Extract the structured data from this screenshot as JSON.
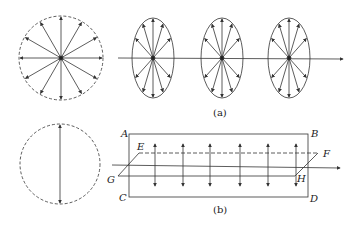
{
  "figure": {
    "part_a": {
      "caption": "(a)",
      "description": "Unpolarized light: radial vectors in all directions, propagating along axis"
    },
    "part_b": {
      "caption": "(b)",
      "description": "Linearly polarized light: vertical vectors in plane ABCD, propagating along axis",
      "labels": {
        "A": "A",
        "B": "B",
        "C": "C",
        "D": "D",
        "E": "E",
        "F": "F",
        "G": "G",
        "H": "H"
      }
    }
  },
  "colors": {
    "stroke": "#333333",
    "background": "#ffffff"
  }
}
